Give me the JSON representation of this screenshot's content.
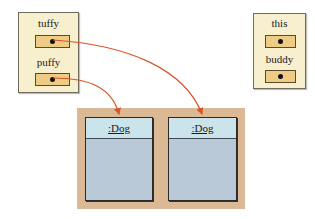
{
  "left_frame": {
    "variables": [
      {
        "name": "tuffy"
      },
      {
        "name": "puffy"
      }
    ]
  },
  "right_frame": {
    "variables": [
      {
        "name": "this"
      },
      {
        "name": "buddy"
      }
    ]
  },
  "heap": {
    "objects": [
      {
        "label": ":Dog"
      },
      {
        "label": ":Dog"
      }
    ]
  },
  "colors": {
    "frame_bg": "#f8efcf",
    "ref_box": "#eecc85",
    "heap_bg": "#dcb995",
    "object_header": "#cbe3ea",
    "object_body": "#b9c9d8",
    "arrow": "#d9542a"
  }
}
